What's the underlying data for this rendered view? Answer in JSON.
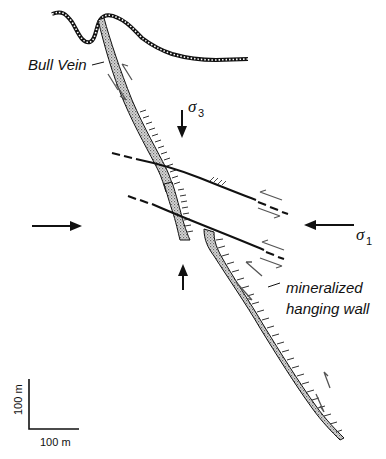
{
  "labels": {
    "bull_vein": "Bull Vein",
    "sigma3_symbol": "σ",
    "sigma3_sub": "3",
    "sigma1_symbol": "σ",
    "sigma1_sub": "1",
    "mineralized_line1": "mineralized",
    "mineralized_line2": "hanging wall"
  },
  "scale_bar": {
    "vertical_label": "100 m",
    "horizontal_label": "100 m"
  },
  "colors": {
    "line": "#111111",
    "vein_fill": "#c8c8c8",
    "shear_arrow": "#555555"
  }
}
